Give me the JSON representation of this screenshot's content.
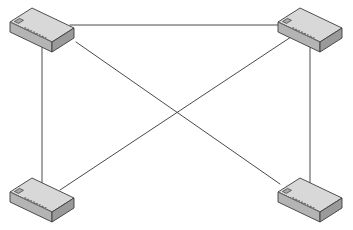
{
  "diagram": {
    "type": "network-topology",
    "canvas": {
      "width": 353,
      "height": 230
    },
    "background_color": "#ffffff",
    "device_type": "network-switch",
    "device_count": 4,
    "link_count": 5,
    "topology_name": "partial-mesh"
  },
  "palette": {
    "outline": "#3c3c3c",
    "top_face": "#d8d8d8",
    "front_face": "#b4b4b4",
    "side_face": "#9a9a9a",
    "port_dark": "#6e6e6e",
    "port_light": "#c8c8c8",
    "led_fill": "#a8a8a8",
    "link_line": "#4a4a4a"
  },
  "devices": [
    {
      "id": "switch-top-left",
      "label": "Switch A",
      "position": "top-left",
      "anchor": {
        "x": 42,
        "y": 26
      },
      "origin": {
        "x": 10,
        "y": 8
      },
      "port_count": 12
    },
    {
      "id": "switch-top-right",
      "label": "Switch B",
      "position": "top-right",
      "anchor": {
        "x": 310,
        "y": 26
      },
      "origin": {
        "x": 278,
        "y": 8
      },
      "port_count": 12
    },
    {
      "id": "switch-bottom-left",
      "label": "Switch C",
      "position": "bottom-left",
      "anchor": {
        "x": 42,
        "y": 196
      },
      "origin": {
        "x": 10,
        "y": 178
      },
      "port_count": 12
    },
    {
      "id": "switch-bottom-right",
      "label": "Switch D",
      "position": "bottom-right",
      "anchor": {
        "x": 310,
        "y": 196
      },
      "origin": {
        "x": 278,
        "y": 178
      },
      "port_count": 12
    }
  ],
  "links": [
    {
      "id": "link-top",
      "label": "Top horizontal link",
      "from": "switch-top-left",
      "to": "switch-top-right",
      "kind": "horizontal",
      "x1": 70,
      "y1": 25,
      "x2": 288,
      "y2": 25
    },
    {
      "id": "link-left",
      "label": "Left vertical link",
      "from": "switch-top-left",
      "to": "switch-bottom-left",
      "kind": "vertical",
      "x1": 42,
      "y1": 38,
      "x2": 42,
      "y2": 196
    },
    {
      "id": "link-right",
      "label": "Right vertical link",
      "from": "switch-top-right",
      "to": "switch-bottom-right",
      "kind": "vertical",
      "x1": 310,
      "y1": 38,
      "x2": 310,
      "y2": 196
    },
    {
      "id": "link-diagonal-tl-br",
      "label": "Diagonal link top-left to bottom-right",
      "from": "switch-top-left",
      "to": "switch-bottom-right",
      "kind": "diagonal",
      "x1": 76,
      "y1": 42,
      "x2": 280,
      "y2": 184
    },
    {
      "id": "link-diagonal-bl-tr",
      "label": "Diagonal link bottom-left to top-right",
      "from": "switch-bottom-left",
      "to": "switch-top-right",
      "kind": "diagonal",
      "x1": 60,
      "y1": 190,
      "x2": 297,
      "y2": 33
    }
  ],
  "crossing_point": {
    "x": 176,
    "y": 113
  }
}
